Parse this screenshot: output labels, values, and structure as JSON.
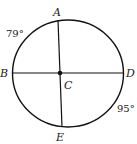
{
  "diagram": {
    "type": "circle-geometry",
    "center": {
      "label": "C"
    },
    "points": [
      {
        "label": "A",
        "position": "top"
      },
      {
        "label": "B",
        "position": "left"
      },
      {
        "label": "D",
        "position": "right"
      },
      {
        "label": "E",
        "position": "bottom"
      }
    ],
    "segments": [
      "AE",
      "BD"
    ],
    "arcs": [
      {
        "name": "arc-AB",
        "measure": "79°"
      },
      {
        "name": "arc-DE",
        "measure": "95°"
      }
    ]
  },
  "labels": {
    "A": "A",
    "B": "B",
    "C": "C",
    "D": "D",
    "E": "E",
    "arc_ab": "79°",
    "arc_de": "95°"
  }
}
